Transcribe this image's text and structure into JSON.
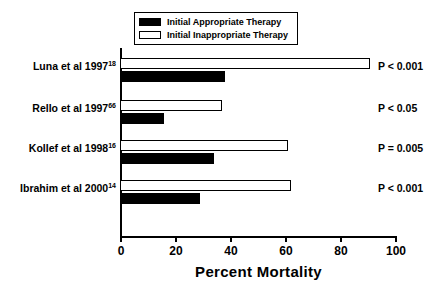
{
  "chart_data": {
    "type": "bar",
    "orientation": "horizontal",
    "title": "",
    "xlabel": "Percent Mortality",
    "ylabel": "",
    "xlim": [
      0,
      100
    ],
    "xticks": [
      0,
      20,
      40,
      60,
      80,
      100
    ],
    "xticklabels": [
      "0",
      "20",
      "40",
      "60",
      "80",
      "100"
    ],
    "grid": false,
    "legend_position": "top-center",
    "categories": [
      "Luna et al 1997",
      "Rello et al 1997",
      "Kollef et al 1998",
      "Ibrahim et al 2000"
    ],
    "category_superscripts": [
      "18",
      "66",
      "16",
      "14"
    ],
    "series": [
      {
        "name": "Initial Inappropriate Therapy",
        "style": "open",
        "color": "#ffffff",
        "edge_color": "#000000",
        "values": [
          91,
          37,
          61,
          62
        ]
      },
      {
        "name": "Initial Appropriate Therapy",
        "style": "filled",
        "color": "#000000",
        "edge_color": "#000000",
        "values": [
          38,
          16,
          34,
          29
        ]
      }
    ],
    "annotations": [
      "P < 0.001",
      "P < 0.05",
      "P = 0.005",
      "P < 0.001"
    ]
  },
  "legend": {
    "items": [
      {
        "label": "Initial Appropriate Therapy",
        "style": "filled"
      },
      {
        "label": "Initial Inappropriate Therapy",
        "style": "open"
      }
    ]
  },
  "axis": {
    "x_title": "Percent Mortality",
    "tick_labels": [
      "0",
      "20",
      "40",
      "60",
      "80",
      "100"
    ]
  },
  "rows": [
    {
      "label": "Luna et al 1997",
      "superscript": "18",
      "inappropriate": 91,
      "appropriate": 38,
      "pvalue": "P < 0.001"
    },
    {
      "label": "Rello et al 1997",
      "superscript": "66",
      "inappropriate": 37,
      "appropriate": 16,
      "pvalue": "P < 0.05"
    },
    {
      "label": "Kollef et al 1998",
      "superscript": "16",
      "inappropriate": 61,
      "appropriate": 34,
      "pvalue": "P = 0.005"
    },
    {
      "label": "Ibrahim et al 2000",
      "superscript": "14",
      "inappropriate": 62,
      "appropriate": 29,
      "pvalue": "P < 0.001"
    }
  ]
}
